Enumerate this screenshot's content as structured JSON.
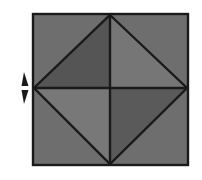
{
  "figure": {
    "title": "Square with inscribed diamond divided into four shaded triangles",
    "caption": "",
    "background_color": "#ffffff",
    "canvas": {
      "width": 202,
      "height": 180
    },
    "outline_color": "#1a1a1a",
    "outline_width": 2.2
  },
  "square": {
    "name": "outer-square",
    "left": 33,
    "top": 14,
    "right": 188,
    "bottom": 165,
    "fill_color": "#6e6e6e",
    "stroke_color": "#1a1a1a",
    "stroke_width": 2.4
  },
  "diamond": {
    "name": "inscribed-diamond",
    "vertices": {
      "top": {
        "x": 110,
        "y": 15
      },
      "right": {
        "x": 187,
        "y": 88
      },
      "bottom": {
        "x": 110,
        "y": 164
      },
      "left": {
        "x": 34,
        "y": 88
      }
    },
    "center": {
      "x": 110,
      "y": 88
    },
    "stroke_color": "#1a1a1a",
    "stroke_width": 2.4
  },
  "triangles": [
    {
      "id": "upper-left",
      "label": "Upper left triangle",
      "fill_color": "#555555",
      "points": "110,15 110,88 34,88"
    },
    {
      "id": "upper-right",
      "label": "Upper right triangle",
      "fill_color": "#767676",
      "points": "110,15 187,88 110,88"
    },
    {
      "id": "lower-left",
      "label": "Lower left triangle",
      "fill_color": "#787878",
      "points": "34,88 110,88 110,164"
    },
    {
      "id": "lower-right",
      "label": "Lower right triangle",
      "fill_color": "#5a5a5a",
      "points": "110,88 187,88 110,164"
    }
  ],
  "corner_fills": [
    {
      "id": "corner-top-left",
      "label": "Top left corner region",
      "fill_color": "#6e6e6e",
      "points": "33,14 110,14 33,88"
    },
    {
      "id": "corner-top-right",
      "label": "Top right corner region",
      "fill_color": "#6e6e6e",
      "points": "110,14 188,14 188,88"
    },
    {
      "id": "corner-bottom-left",
      "label": "Bottom left corner region",
      "fill_color": "#6e6e6e",
      "points": "33,88 110,165 33,165"
    },
    {
      "id": "corner-bottom-right",
      "label": "Bottom right corner region",
      "fill_color": "#6e6e6e",
      "points": "188,88 188,165 110,165"
    }
  ],
  "center_lines": [
    {
      "id": "horizontal-center-line",
      "label": "Horizontal center line",
      "x1": 34,
      "y1": 88,
      "x2": 187,
      "y2": 88
    },
    {
      "id": "vertical-center-line",
      "label": "Vertical center line",
      "x1": 110,
      "y1": 15,
      "x2": 110,
      "y2": 164
    }
  ],
  "arrow_marker": {
    "name": "vertical-double-arrow",
    "label": "Vertical double-headed arrow",
    "color": "#1a1a1a",
    "center_x": 24,
    "top_y": 72,
    "bottom_y": 104,
    "gap_top": 86,
    "gap_bottom": 90,
    "half_width": 4.5,
    "shaft_width": 1.8
  }
}
